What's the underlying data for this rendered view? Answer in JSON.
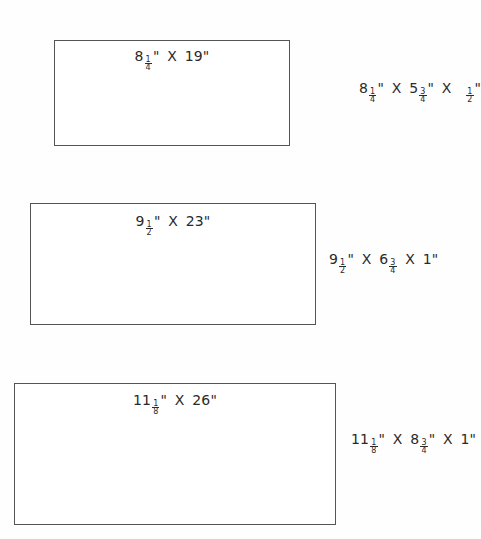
{
  "boxes": [
    {
      "id": "box-1",
      "rect": {
        "left": 54,
        "top": 40,
        "width": 236,
        "height": 106
      },
      "label": {
        "whole1": "8",
        "num1": "1",
        "den1": "4",
        "unit1": "\"",
        "sep": "X",
        "value2": "19\""
      },
      "side_label": {
        "left": 359,
        "top": 80,
        "parts": [
          {
            "whole": "8",
            "num": "1",
            "den": "4",
            "unit": "\""
          },
          {
            "whole": "5",
            "num": "3",
            "den": "4",
            "unit": "\""
          },
          {
            "whole": "",
            "num": "1",
            "den": "2",
            "unit": "\""
          }
        ],
        "sep": "X"
      }
    },
    {
      "id": "box-2",
      "rect": {
        "left": 30,
        "top": 203,
        "width": 286,
        "height": 122
      },
      "label": {
        "whole1": "9",
        "num1": "1",
        "den1": "2",
        "unit1": "\"",
        "sep": "X",
        "value2": "23\""
      },
      "side_label": {
        "left": 329,
        "top": 251,
        "parts": [
          {
            "whole": "9",
            "num": "1",
            "den": "2",
            "unit": "\""
          },
          {
            "whole": "6",
            "num": "3",
            "den": "4",
            "unit": ""
          },
          {
            "whole": "1",
            "num": "",
            "den": "",
            "unit": "\""
          }
        ],
        "sep": "X"
      }
    },
    {
      "id": "box-3",
      "rect": {
        "left": 14,
        "top": 383,
        "width": 322,
        "height": 142
      },
      "label": {
        "whole1": "11",
        "num1": "1",
        "den1": "8",
        "unit1": "\"",
        "sep": "X",
        "value2": "26\""
      },
      "side_label": {
        "left": 351,
        "top": 431,
        "parts": [
          {
            "whole": "11",
            "num": "1",
            "den": "8",
            "unit": "\""
          },
          {
            "whole": "8",
            "num": "3",
            "den": "4",
            "unit": "\""
          },
          {
            "whole": "1",
            "num": "",
            "den": "",
            "unit": "\""
          }
        ],
        "sep": "X"
      }
    }
  ]
}
